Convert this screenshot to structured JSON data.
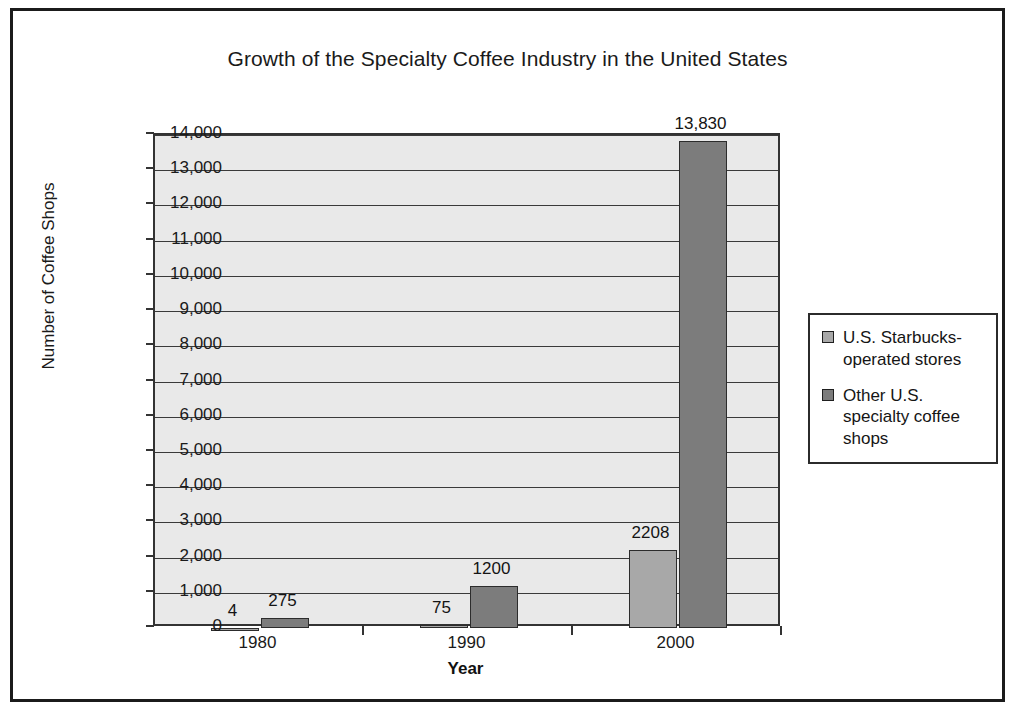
{
  "chart_data": {
    "type": "bar",
    "title": "Growth of the Specialty Coffee Industry in the United States",
    "xlabel": "Year",
    "ylabel": "Number of Coffee Shops",
    "categories": [
      "1980",
      "1990",
      "2000"
    ],
    "series": [
      {
        "name": "U.S. Starbucks-operated stores",
        "color": "#a8a8a8",
        "values": [
          4,
          75,
          2208
        ],
        "labels": [
          "4",
          "75",
          "2208"
        ]
      },
      {
        "name": "Other U.S. specialty coffee shops",
        "color": "#7c7c7c",
        "values": [
          275,
          1200,
          13830
        ],
        "labels": [
          "275",
          "1200",
          "13,830"
        ]
      }
    ],
    "ylim": [
      0,
      14000
    ],
    "ytick_labels": [
      "14,000",
      "13,000",
      "12,000",
      "11,000",
      "10,000",
      "9,000",
      "8,000",
      "7,000",
      "6,000",
      "5,000",
      "4,000",
      "3,000",
      "2,000",
      "1,000",
      "0"
    ],
    "ytick_values": [
      14000,
      13000,
      12000,
      11000,
      10000,
      9000,
      8000,
      7000,
      6000,
      5000,
      4000,
      3000,
      2000,
      1000,
      0
    ],
    "grid": true,
    "legend_position": "right",
    "plot_background": "#e9e9e9",
    "frame_color": "#1b1b1b"
  },
  "legend": {
    "entries": [
      {
        "label": "U.S. Starbucks-operated stores",
        "color": "#a8a8a8"
      },
      {
        "label": "Other U.S. specialty coffee shops",
        "color": "#7c7c7c"
      }
    ]
  }
}
